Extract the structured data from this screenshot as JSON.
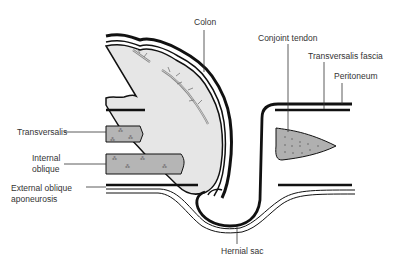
{
  "diagram": {
    "type": "anatomical-cross-section",
    "colors": {
      "colon_fill": "#e6e6e6",
      "muscle_fill": "#b5b5b5",
      "tendon_fill": "#b0b0b0",
      "outline": "#111111",
      "vessel": "#999999"
    }
  },
  "labels": {
    "colon": "Colon",
    "conjoint_tendon": "Conjoint tendon",
    "transversalis_fascia": "Transversalis fascia",
    "peritoneum": "Peritoneum",
    "transversalis": "Transversalis",
    "internal_oblique_1": "Internal",
    "internal_oblique_2": "oblique",
    "external_oblique_1": "External oblique",
    "external_oblique_2": "aponeurosis",
    "hernial_sac": "Hernial sac"
  }
}
